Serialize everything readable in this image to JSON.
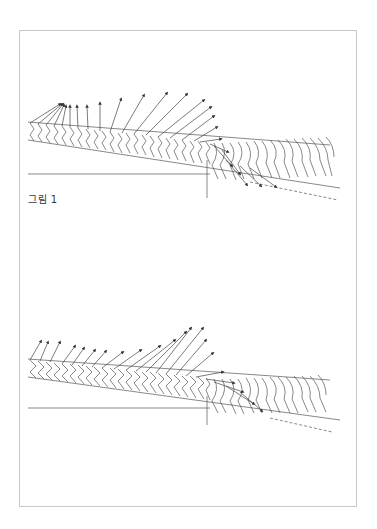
{
  "figures": [
    {
      "caption": "그림 1",
      "description": "Stick-figure motion sequence with force vector arrows, skier descending slope"
    },
    {
      "caption": "그림 2",
      "description": "Stick-figure motion sequence with force vector arrows, skier descending slope"
    }
  ],
  "colors": {
    "line": "#444444",
    "frame": "#c8c8c8",
    "background": "#ffffff"
  }
}
